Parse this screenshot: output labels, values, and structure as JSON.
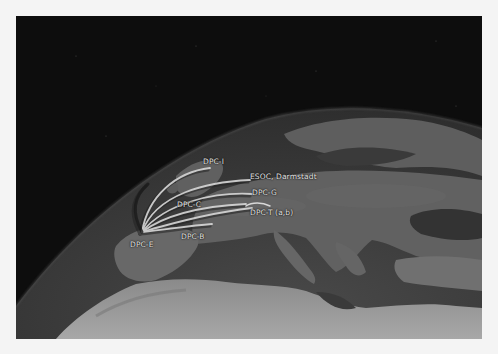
{
  "map": {
    "view": "Europe from orbit, grayscale satellite imagery",
    "origin": "DPC-E",
    "labels": [
      {
        "id": "dpc-i",
        "text": "DPC-I"
      },
      {
        "id": "esoc",
        "text": "ESOC, Darmstadt"
      },
      {
        "id": "dpc-g",
        "text": "DPC-G"
      },
      {
        "id": "dpc-c",
        "text": "DPC-C"
      },
      {
        "id": "dpc-t",
        "text": "DPC-T (a,b)"
      },
      {
        "id": "dpc-b",
        "text": "DPC-B"
      },
      {
        "id": "dpc-e",
        "text": "DPC-E"
      }
    ],
    "colors": {
      "space": "#0d0d0d",
      "ocean": "#3c3c3c",
      "land": "#6e6e6e",
      "desert": "#9a9a9a",
      "arc": "#d8d8d8",
      "label": "#e6e6e6",
      "border": "#f4f4f4"
    }
  }
}
